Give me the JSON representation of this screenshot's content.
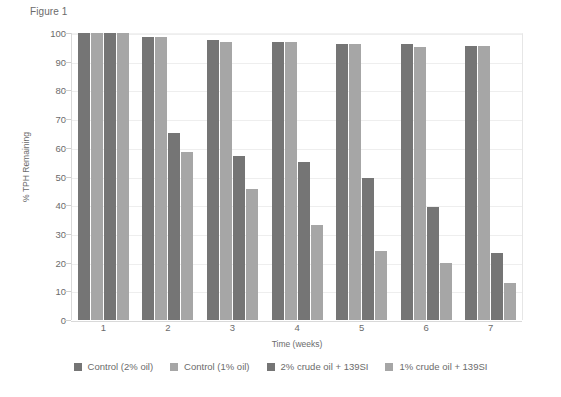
{
  "figure_caption": "Figure 1",
  "chart_data": {
    "type": "bar",
    "title": "",
    "xlabel": "Time (weeks)",
    "ylabel": "% TPH Remaining",
    "categories": [
      "1",
      "2",
      "3",
      "4",
      "5",
      "6",
      "7"
    ],
    "ylim": [
      0,
      100
    ],
    "yticks": [
      "0",
      "10",
      "20",
      "30",
      "40",
      "50",
      "60",
      "70",
      "80",
      "90",
      "100"
    ],
    "grid": true,
    "legend_position": "bottom",
    "series": [
      {
        "name": "Control (2% oil)",
        "color": "#757575",
        "values": [
          100,
          98.5,
          97.5,
          97,
          96,
          96,
          95.5
        ]
      },
      {
        "name": "Control (1% oil)",
        "color": "#a6a6a6",
        "values": [
          100,
          98.5,
          97,
          97,
          96,
          95,
          95.5
        ]
      },
      {
        "name": "2% crude oil + 139SI",
        "color": "#757575",
        "values": [
          100,
          65,
          57,
          55,
          49.5,
          39.5,
          23.5
        ]
      },
      {
        "name": "1% crude oil + 139SI",
        "color": "#a6a6a6",
        "values": [
          100,
          58.5,
          45.5,
          33,
          24,
          20,
          13
        ]
      }
    ]
  }
}
